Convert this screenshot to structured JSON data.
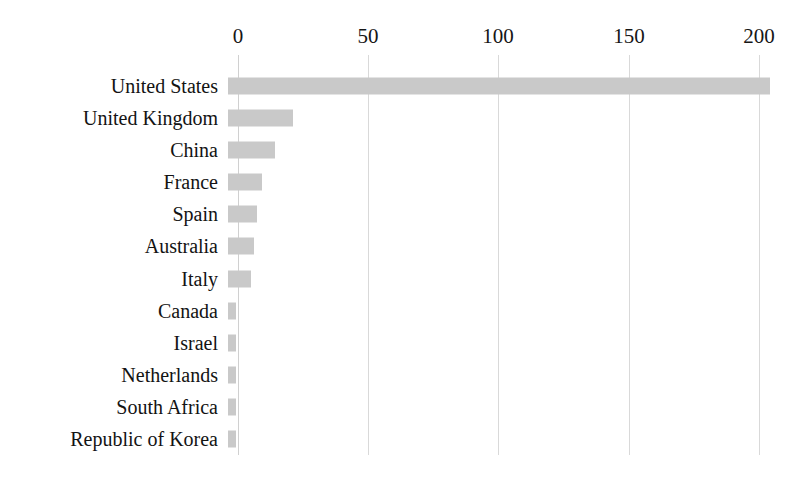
{
  "chart_data": {
    "type": "bar",
    "orientation": "horizontal",
    "title": "",
    "subtitle": "",
    "xlabel": "",
    "ylabel": "",
    "xlim": [
      0,
      200
    ],
    "ylim": null,
    "grid": true,
    "grid_axis": "x",
    "legend": false,
    "legend_position": "none",
    "axis_position": "top",
    "bar_color": "#c9c9c9",
    "grid_color": "#d9d9d9",
    "text_color": "#131313",
    "background": "#ffffff",
    "xticks": [
      0,
      50,
      100,
      150,
      200
    ],
    "xtick_labels": [
      "0",
      "50",
      "100",
      "150",
      "200"
    ],
    "categories": [
      "United States",
      "United Kingdom",
      "China",
      "France",
      "Spain",
      "Australia",
      "Italy",
      "Canada",
      "Israel",
      "Netherlands",
      "South Africa",
      "Republic of Korea"
    ],
    "values": [
      208,
      25,
      18,
      13,
      11,
      10,
      9,
      3,
      3,
      3,
      3,
      3
    ]
  }
}
